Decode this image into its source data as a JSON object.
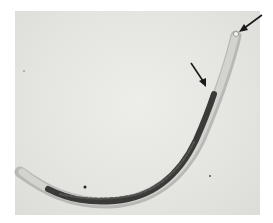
{
  "image": {
    "subject": "nematode micrograph",
    "background_color": "#e6e6e3",
    "body_color": "#3a3a38",
    "arrow_color": "#1a1a1a",
    "arrows": [
      {
        "name": "head-tip-arrow",
        "from": [
          262,
          15
        ],
        "to": [
          240,
          31
        ]
      },
      {
        "name": "body-arrow",
        "from": [
          191,
          63
        ],
        "to": [
          206,
          86
        ]
      }
    ]
  }
}
